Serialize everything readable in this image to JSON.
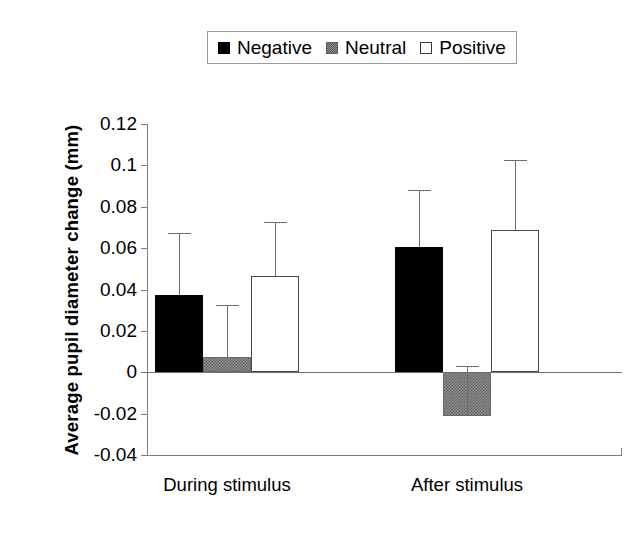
{
  "chart_data": {
    "type": "bar",
    "title": "",
    "xlabel": "",
    "ylabel": "Average pupil diameter change (mm)",
    "categories": [
      "During stimulus",
      "After stimulus"
    ],
    "ylim": [
      -0.04,
      0.12
    ],
    "ytick_labels": [
      "0.12",
      "0.1",
      "0.08",
      "0.06",
      "0.04",
      "0.02",
      "0",
      "-0.02",
      "-0.04"
    ],
    "ytick_values": [
      0.12,
      0.1,
      0.08,
      0.06,
      0.04,
      0.02,
      0,
      -0.02,
      -0.04
    ],
    "grid": false,
    "legend_position": "top-center",
    "error_bar_type": "upper-only",
    "series": [
      {
        "name": "Negative",
        "color": "#000000",
        "values": [
          0.0375,
          0.0605
        ],
        "errors_upper": [
          0.0675,
          0.088
        ]
      },
      {
        "name": "Neutral",
        "color": "#8d8d8d",
        "values": [
          0.0073,
          -0.0212
        ],
        "errors_upper": [
          0.0325,
          0.003
        ]
      },
      {
        "name": "Positive",
        "color": "#ffffff",
        "values": [
          0.0465,
          0.069
        ],
        "errors_upper": [
          0.0725,
          0.1025
        ]
      }
    ]
  },
  "legend": {
    "entries": [
      {
        "label": "Negative",
        "swatch": "legend-swatch-black"
      },
      {
        "label": "Neutral",
        "swatch": "legend-swatch-gray"
      },
      {
        "label": "Positive",
        "swatch": "legend-swatch-white"
      }
    ]
  },
  "axis": {
    "y_title": "Average pupil diameter change (mm)",
    "y_labels": [
      "0.12",
      "0.1",
      "0.08",
      "0.06",
      "0.04",
      "0.02",
      "0",
      "-0.02",
      "-0.04"
    ],
    "x_labels": [
      "During stimulus",
      "After stimulus"
    ]
  },
  "colors": {
    "negative": "#000000",
    "neutral": "#8d8d8d",
    "positive": "#ffffff",
    "axis": "#7d7d7d",
    "background": "#ffffff"
  }
}
